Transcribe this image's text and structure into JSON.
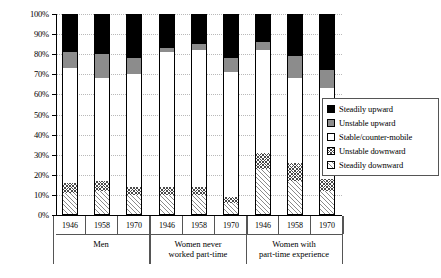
{
  "chart_data": {
    "type": "bar",
    "title": "",
    "subtitle": "",
    "xlabel": "",
    "ylabel": "",
    "ylim": [
      0,
      100
    ],
    "stacked": true,
    "stack_mode": "percent",
    "grid": true,
    "legend_position": "right",
    "y_ticks": [
      "0%",
      "10%",
      "20%",
      "30%",
      "40%",
      "50%",
      "60%",
      "70%",
      "80%",
      "90%",
      "100%"
    ],
    "y_tick_values": [
      0,
      10,
      20,
      30,
      40,
      50,
      60,
      70,
      80,
      90,
      100
    ],
    "categories": [
      "1946",
      "1958",
      "1970",
      "1946",
      "1958",
      "1970",
      "1946",
      "1958",
      "1970"
    ],
    "groups": [
      {
        "label": "Men",
        "categories": [
          "1946",
          "1958",
          "1970"
        ]
      },
      {
        "label": "Women never\nworked part-time",
        "line1": "Women never",
        "line2": "worked part-time",
        "categories": [
          "1946",
          "1958",
          "1970"
        ]
      },
      {
        "label": "Women with\npart-time experience",
        "line1": "Women with",
        "line2": "part-time experience",
        "categories": [
          "1946",
          "1958",
          "1970"
        ]
      }
    ],
    "series": [
      {
        "name": "Steadily upward",
        "key": "su",
        "color": "#000000",
        "pattern": "solid",
        "values": [
          19,
          20,
          22,
          17,
          15,
          22,
          14,
          21,
          28
        ]
      },
      {
        "name": "Unstable upward",
        "key": "uu",
        "color": "#8c8c8c",
        "pattern": "solid",
        "values": [
          8,
          12,
          8,
          2,
          3,
          7,
          4,
          11,
          9
        ]
      },
      {
        "name": "Stable/counter-mobile",
        "key": "sc",
        "color": "#ffffff",
        "pattern": "none",
        "values": [
          57,
          51,
          56,
          67,
          68,
          62,
          51,
          42,
          45
        ]
      },
      {
        "name": "Unstable downward",
        "key": "ud",
        "color": "#ffffff",
        "pattern": "crosshatch",
        "values": [
          5,
          5,
          4,
          4,
          4,
          3,
          8,
          9,
          6
        ]
      },
      {
        "name": "Steadily downward",
        "key": "sd",
        "color": "#ffffff",
        "pattern": "diagonal",
        "values": [
          11,
          12,
          10,
          10,
          10,
          6,
          23,
          17,
          12
        ]
      }
    ],
    "bars": [
      {
        "group": "Men",
        "category": "1946",
        "su": 19,
        "uu": 8,
        "sc": 57,
        "ud": 5,
        "sd": 11
      },
      {
        "group": "Men",
        "category": "1958",
        "su": 20,
        "uu": 12,
        "sc": 51,
        "ud": 5,
        "sd": 12
      },
      {
        "group": "Men",
        "category": "1970",
        "su": 22,
        "uu": 8,
        "sc": 56,
        "ud": 4,
        "sd": 10
      },
      {
        "group": "Women never worked part-time",
        "category": "1946",
        "su": 17,
        "uu": 2,
        "sc": 67,
        "ud": 4,
        "sd": 10
      },
      {
        "group": "Women never worked part-time",
        "category": "1958",
        "su": 15,
        "uu": 3,
        "sc": 68,
        "ud": 4,
        "sd": 10
      },
      {
        "group": "Women never worked part-time",
        "category": "1970",
        "su": 22,
        "uu": 7,
        "sc": 62,
        "ud": 3,
        "sd": 6
      },
      {
        "group": "Women with part-time experience",
        "category": "1946",
        "su": 14,
        "uu": 4,
        "sc": 51,
        "ud": 8,
        "sd": 23
      },
      {
        "group": "Women with part-time experience",
        "category": "1958",
        "su": 21,
        "uu": 11,
        "sc": 42,
        "ud": 9,
        "sd": 17
      },
      {
        "group": "Women with part-time experience",
        "category": "1970",
        "su": 28,
        "uu": 9,
        "sc": 45,
        "ud": 6,
        "sd": 12
      }
    ],
    "legend": [
      {
        "label": "Steadily upward",
        "key": "su"
      },
      {
        "label": "Unstable upward",
        "key": "uu"
      },
      {
        "label": "Stable/counter-mobile",
        "key": "sc"
      },
      {
        "label": "Unstable downward",
        "key": "ud"
      },
      {
        "label": "Steadily downward",
        "key": "sd"
      }
    ]
  }
}
